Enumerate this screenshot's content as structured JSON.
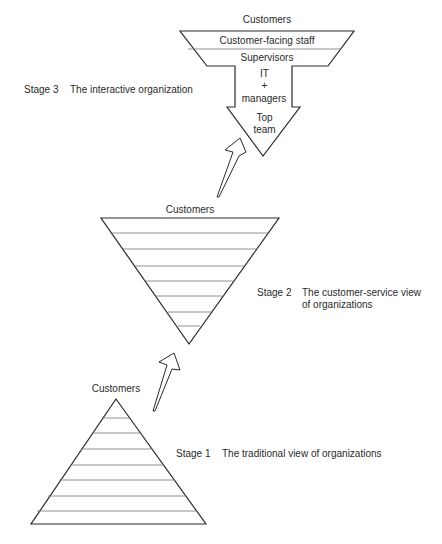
{
  "diagram": {
    "stage3": {
      "label": "Stage 3",
      "title": "The interactive organization",
      "top_label": "Customers",
      "layers": [
        "Customer-facing staff",
        "Supervisors",
        "IT",
        "+",
        "managers",
        "Top",
        "team"
      ]
    },
    "stage2": {
      "label": "Stage 2",
      "title_line1": "The customer-service view",
      "title_line2": "of organizations",
      "top_label": "Customers"
    },
    "stage1": {
      "label": "Stage 1",
      "title": "The traditional view of organizations",
      "top_label": "Customers"
    },
    "colors": {
      "line": "#2a2a2a",
      "layer_line": "#777777",
      "background": "#ffffff"
    }
  }
}
